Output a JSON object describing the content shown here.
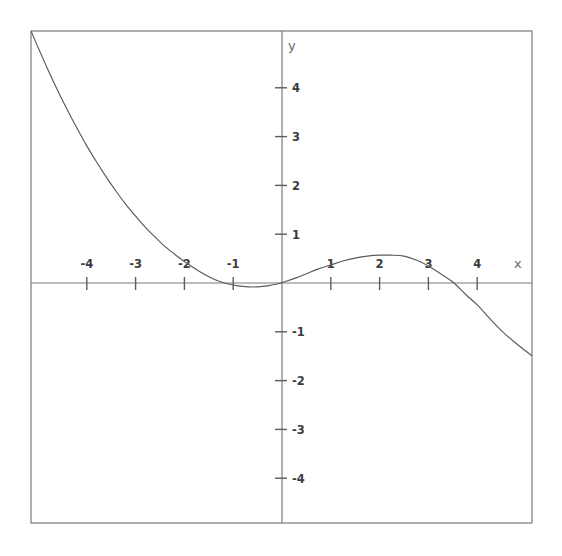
{
  "figure": {
    "background_color": "#ffffff",
    "frame_color": "#6e6e6e",
    "axis_color": "#7a7a7a",
    "curve_color": "#5a5a5a",
    "label_color": "#3c3c3c",
    "axis_name_color": "#6a6a6a"
  },
  "axes": {
    "x_axis_label": "x",
    "y_axis_label": "y",
    "origin_px": {
      "x": 282,
      "y": 283
    },
    "unit_px": 48.8,
    "frame_px": {
      "left": 31,
      "top": 31,
      "right": 532,
      "bottom": 523
    }
  },
  "chart_data": {
    "type": "line",
    "title": "",
    "xlabel": "x",
    "ylabel": "y",
    "grid": false,
    "legend": false,
    "xlim": [
      -5.14,
      5.12
    ],
    "ylim": [
      -4.92,
      5.16
    ],
    "xticks": [
      -4,
      -3,
      -2,
      -1,
      1,
      2,
      3,
      4
    ],
    "xtick_labels": [
      "-4",
      "-3",
      "-2",
      "-1",
      "1",
      "2",
      "3",
      "4"
    ],
    "yticks": [
      -4,
      -3,
      -2,
      -1,
      1,
      2,
      3,
      4
    ],
    "ytick_labels": [
      "-4",
      "-3",
      "-2",
      "-1",
      "1",
      "2",
      "3",
      "4"
    ],
    "series": [
      {
        "name": "curve",
        "x": [
          -5.14,
          -5.0,
          -4.8,
          -4.6,
          -4.4,
          -4.2,
          -4.0,
          -3.8,
          -3.6,
          -3.4,
          -3.2,
          -3.0,
          -2.8,
          -2.6,
          -2.4,
          -2.2,
          -2.0,
          -1.85,
          -1.7,
          -1.5,
          -1.3,
          -1.1,
          -0.9,
          -0.7,
          -0.5,
          -0.3,
          -0.1,
          0.1,
          0.3,
          0.5,
          0.75,
          1.0,
          1.25,
          1.5,
          1.75,
          2.0,
          2.25,
          2.5,
          2.75,
          3.0,
          3.25,
          3.5,
          3.77,
          4.0,
          4.25,
          4.5,
          4.75,
          5.0,
          5.12
        ],
        "y": [
          5.16,
          4.83,
          4.38,
          3.95,
          3.55,
          3.17,
          2.81,
          2.48,
          2.17,
          1.88,
          1.61,
          1.37,
          1.14,
          0.94,
          0.75,
          0.59,
          0.44,
          0.34,
          0.24,
          0.13,
          0.04,
          -0.02,
          -0.06,
          -0.08,
          -0.08,
          -0.06,
          -0.02,
          0.04,
          0.11,
          0.19,
          0.29,
          0.37,
          0.45,
          0.51,
          0.55,
          0.57,
          0.57,
          0.55,
          0.47,
          0.35,
          0.19,
          0.02,
          -0.24,
          -0.45,
          -0.72,
          -0.98,
          -1.2,
          -1.4,
          -1.49
        ]
      }
    ],
    "annotations": [
      {
        "label": "local minimum",
        "x": -0.6,
        "y": -0.08
      },
      {
        "label": "local maximum",
        "x": 2.3,
        "y": 0.57
      }
    ]
  }
}
